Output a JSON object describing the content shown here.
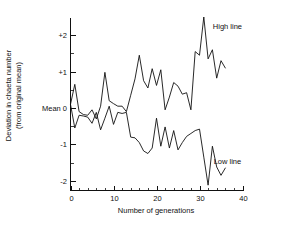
{
  "chart_data": {
    "type": "line",
    "title": "",
    "xlabel": "Number of generations",
    "ylabel_line1": "Deviation in chaeta number",
    "ylabel_line2": "(from original mean)",
    "xlim": [
      0,
      40
    ],
    "ylim": [
      -2.3,
      2.6
    ],
    "xticks": [
      0,
      10,
      20,
      30,
      40
    ],
    "xtick_labels": [
      "0",
      "10",
      "20",
      "30",
      "40"
    ],
    "xtick_minor_step": 2,
    "yticks": [
      2,
      1,
      0,
      -1,
      -2
    ],
    "ytick_labels": [
      "+2",
      "+1",
      "Mean 0",
      "-1",
      "-2"
    ],
    "grid": false,
    "legend_position": "inline-right",
    "series": [
      {
        "name": "High line",
        "label": "High line",
        "label_x": 36.5,
        "label_y": 2.25,
        "x": [
          0,
          1,
          2,
          3,
          4,
          5,
          6,
          7,
          8,
          9,
          10,
          11,
          12,
          13,
          14,
          15,
          16,
          17,
          18,
          19,
          20,
          21,
          22,
          23,
          24,
          25,
          26,
          27,
          28,
          29,
          30,
          31,
          32,
          33,
          34,
          35,
          36
        ],
        "values": [
          0.1,
          0.65,
          -0.1,
          -0.18,
          -0.2,
          -0.05,
          -0.3,
          0.05,
          0.98,
          0.2,
          0.12,
          0.05,
          0.05,
          -0.1,
          0.35,
          0.8,
          1.45,
          0.75,
          0.55,
          1.08,
          0.62,
          1.05,
          -0.05,
          0.3,
          0.7,
          0.6,
          0.38,
          0.42,
          -0.05,
          1.55,
          1.45,
          2.5,
          1.35,
          1.6,
          0.82,
          1.3,
          1.1
        ]
      },
      {
        "name": "Low line",
        "label": "Low line",
        "label_x": 36.5,
        "label_y": -1.45,
        "x": [
          0,
          1,
          2,
          3,
          4,
          5,
          6,
          7,
          8,
          9,
          10,
          11,
          12,
          13,
          14,
          15,
          16,
          17,
          18,
          19,
          20,
          21,
          22,
          23,
          24,
          25,
          26,
          27,
          28,
          29,
          30,
          31,
          32,
          33,
          34,
          35,
          36
        ],
        "values": [
          0.1,
          -0.55,
          -0.2,
          -0.22,
          -0.25,
          -0.42,
          -0.12,
          -0.6,
          -0.28,
          0.05,
          -0.45,
          -0.12,
          -0.15,
          -0.12,
          -0.8,
          -0.82,
          -0.95,
          -1.18,
          -1.25,
          -1.1,
          -0.28,
          -1.05,
          -0.52,
          -1.1,
          -0.62,
          -1.15,
          -0.95,
          -0.78,
          -0.7,
          -0.62,
          -0.58,
          -1.35,
          -2.12,
          -1.05,
          -1.62,
          -1.85,
          -1.65
        ]
      }
    ]
  }
}
